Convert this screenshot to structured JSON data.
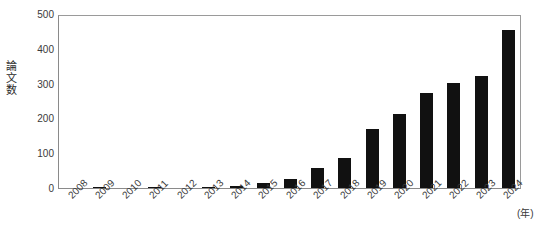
{
  "chart_data": {
    "type": "bar",
    "title": "",
    "xlabel": "(年)",
    "ylabel": "論文数",
    "ylim": [
      0,
      500
    ],
    "yticks": [
      0,
      100,
      200,
      300,
      400,
      500
    ],
    "grid": false,
    "legend": null,
    "bar_color": "#111111",
    "categories": [
      "2008",
      "2009",
      "2010",
      "2011",
      "2012",
      "2013",
      "2014",
      "2015",
      "2016",
      "2017",
      "2018",
      "2019",
      "2020",
      "2021",
      "2022",
      "2023",
      "2024"
    ],
    "values": [
      0,
      1,
      0,
      2,
      0,
      2,
      7,
      14,
      26,
      58,
      87,
      170,
      212,
      272,
      302,
      321,
      455
    ]
  },
  "axis": {
    "x_unit_label": "(年)",
    "y_title": "論文数"
  }
}
